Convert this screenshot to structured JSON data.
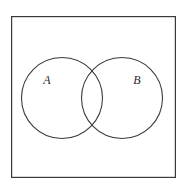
{
  "figure": {
    "kind": "venn-diagram",
    "width": 186,
    "height": 184,
    "background_color": "#ffffff",
    "stroke_color": "#3a3a3a",
    "label_color": "#2b2b2b"
  },
  "universe": {
    "name": "universal-set-rectangle",
    "x": 11,
    "y": 16,
    "width": 165,
    "height": 162,
    "stroke_width": 1.2,
    "fill": "none"
  },
  "sets": [
    {
      "id": "set-a",
      "label": "A",
      "cx": 62,
      "cy": 98,
      "r": 40.5,
      "stroke_width": 1.1,
      "fill": "none",
      "label_x": 47,
      "label_y": 84
    },
    {
      "id": "set-b",
      "label": "B",
      "cx": 122,
      "cy": 98,
      "r": 40.5,
      "stroke_width": 1.1,
      "fill": "none",
      "label_x": 137,
      "label_y": 84
    }
  ],
  "intersection": {
    "name": "overlap-region",
    "label": "",
    "upper_point_x": 92,
    "upper_point_y": 68,
    "lower_point_x": 92,
    "lower_point_y": 128
  },
  "chart_data": {
    "type": "venn",
    "title": "",
    "sets": [
      "A",
      "B"
    ],
    "set_labels": [
      "A",
      "B"
    ],
    "regions": [
      "A only",
      "A and B",
      "B only"
    ],
    "values": [
      null,
      null,
      null
    ],
    "universe_shown": true,
    "grid": false,
    "legend": "none"
  }
}
